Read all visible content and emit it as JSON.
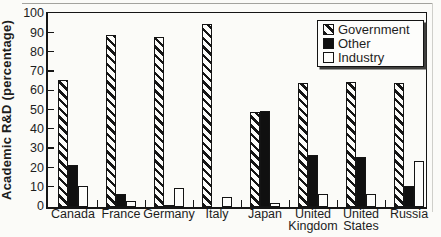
{
  "figure": {
    "background": "#fbfbf8",
    "ink_color": "#161616"
  },
  "chart_data": {
    "type": "bar",
    "title": "",
    "ylabel": "Academic R&D (percentage)",
    "ylim": [
      0,
      100
    ],
    "yticks": [
      0,
      10,
      20,
      30,
      40,
      50,
      60,
      70,
      80,
      90,
      100
    ],
    "grid": false,
    "legend_position": "top-right",
    "categories": [
      "Canada",
      "France",
      "Germany",
      "Italy",
      "Japan",
      "United Kingdom",
      "United States",
      "Russia"
    ],
    "series": [
      {
        "name": "Government",
        "style": "hatched",
        "values": [
          66,
          89,
          88,
          95,
          49,
          64,
          65,
          64
        ]
      },
      {
        "name": "Other",
        "style": "black",
        "values": [
          22,
          7,
          1,
          0,
          50,
          27,
          26,
          11
        ]
      },
      {
        "name": "Industry",
        "style": "white",
        "values": [
          11,
          3,
          10,
          5,
          2,
          7,
          7,
          24
        ]
      }
    ]
  }
}
